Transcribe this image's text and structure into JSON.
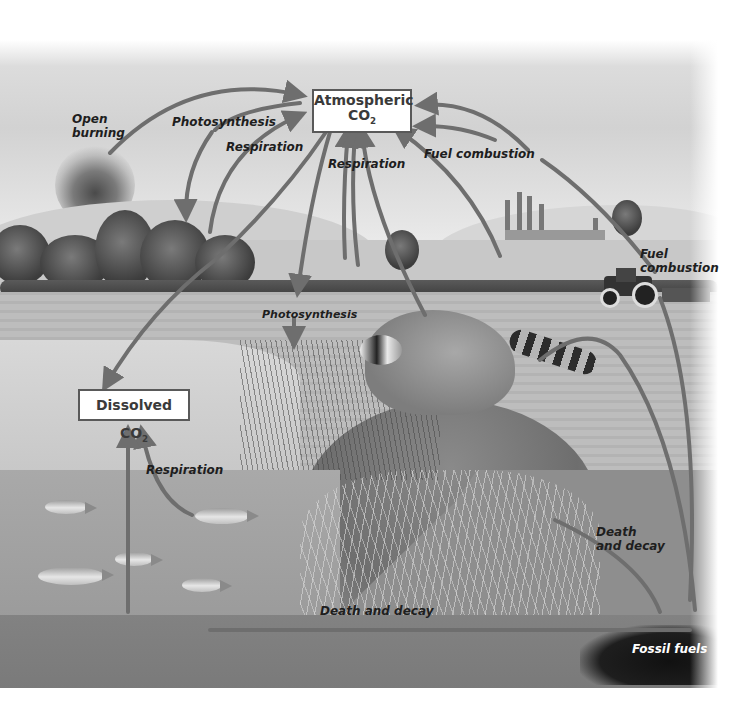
{
  "diagram": {
    "colors": {
      "arrow": "#6e6e6e",
      "box_border": "#595959",
      "box_text": "#3a3a3a",
      "label_text": "#1e1e1e",
      "fossil_label": "#ffffff"
    },
    "boxes": {
      "atmospheric": {
        "line1": "Atmospheric",
        "line2": "CO",
        "sub": "2"
      },
      "dissolved": {
        "text": "Dissolved CO",
        "sub": "2"
      }
    },
    "labels": {
      "open_burning": {
        "line1": "Open",
        "line2": "burning"
      },
      "photosynthesis_top": "Photosynthesis",
      "respiration_left": "Respiration",
      "respiration_center": "Respiration",
      "fuel_combustion_top": "Fuel combustion",
      "fuel_combustion_tractor": {
        "line1": "Fuel",
        "line2": "combustion"
      },
      "photosynthesis_pond": "Photosynthesis",
      "respiration_water": "Respiration",
      "death_decay_right": {
        "line1": "Death",
        "line2": "and decay"
      },
      "death_decay_bottom": "Death and decay",
      "fossil_fuels": "Fossil fuels"
    },
    "flows": [
      {
        "from": "Open burning",
        "to": "Atmospheric CO2"
      },
      {
        "from": "Atmospheric CO2",
        "to": "Plants",
        "label": "Photosynthesis"
      },
      {
        "from": "Plants",
        "to": "Atmospheric CO2",
        "label": "Respiration"
      },
      {
        "from": "Animals",
        "to": "Atmospheric CO2",
        "label": "Respiration"
      },
      {
        "from": "Factories",
        "to": "Atmospheric CO2",
        "label": "Fuel combustion"
      },
      {
        "from": "Tractor",
        "to": "Atmospheric CO2",
        "label": "Fuel combustion"
      },
      {
        "from": "Atmospheric CO2",
        "to": "Dissolved CO2"
      },
      {
        "from": "Dissolved CO2",
        "to": "Atmospheric CO2"
      },
      {
        "from": "Atmospheric CO2",
        "to": "Reeds",
        "label": "Photosynthesis"
      },
      {
        "from": "Fish",
        "to": "Dissolved CO2",
        "label": "Respiration"
      },
      {
        "from": "Organisms",
        "to": "Fossil fuels",
        "label": "Death and decay"
      },
      {
        "from": "Fossil fuels",
        "to": "Atmospheric CO2"
      }
    ]
  }
}
